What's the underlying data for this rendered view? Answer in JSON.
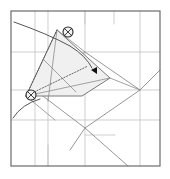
{
  "figure": {
    "type": "origami-crease-pattern",
    "title": "",
    "background_color": "#ffffff",
    "paper": {
      "name": "square-sheet",
      "x": 11,
      "y": 11,
      "width": 149,
      "height": 155,
      "border_color": "#6b6b6b",
      "border_width": 1.2,
      "fill": "#ffffff"
    },
    "grid": {
      "color": "#b9b9b9",
      "width": 0.7,
      "vertical_x": [
        35,
        48,
        85,
        140
      ],
      "horizontal_y": [
        52,
        90,
        120
      ]
    },
    "short_ticks": [
      {
        "name": "tick-top-center",
        "x1": 85,
        "y1": 11,
        "x2": 85,
        "y2": 24
      },
      {
        "name": "tick-top-right",
        "x1": 114,
        "y1": 11,
        "x2": 114,
        "y2": 24
      },
      {
        "name": "tick-bottom-left",
        "x1": 48,
        "y1": 166,
        "x2": 48,
        "y2": 145
      },
      {
        "name": "tick-mid-horizontal",
        "x1": 85,
        "y1": 135,
        "x2": 115,
        "y2": 135
      }
    ],
    "diamond": {
      "name": "rotated-square",
      "color": "#8a8a8a",
      "width": 0.9,
      "points": [
        [
          85,
          52
        ],
        [
          140,
          90
        ],
        [
          85,
          128
        ],
        [
          35,
          90
        ]
      ]
    },
    "diagonals": [
      {
        "name": "diagonal-lower-right",
        "x1": 85,
        "y1": 128,
        "x2": 128,
        "y2": 166
      },
      {
        "name": "diagonal-lower-left",
        "x1": 85,
        "y1": 128,
        "x2": 70,
        "y2": 150
      },
      {
        "name": "diagonal-right-edge",
        "x1": 140,
        "y1": 90,
        "x2": 160,
        "y2": 70
      }
    ],
    "flap": {
      "name": "folded-flap",
      "fill": "#f0f0f0",
      "stroke": "#7a7a7a",
      "stroke_width": 1.0,
      "points": [
        [
          26,
          96
        ],
        [
          57,
          30
        ],
        [
          110,
          78
        ],
        [
          82,
          96
        ]
      ]
    },
    "flap_inner_creases": [
      {
        "name": "flap-crease-a",
        "x1": 26,
        "y1": 96,
        "x2": 110,
        "y2": 78
      },
      {
        "name": "flap-crease-b",
        "x1": 44,
        "y1": 60,
        "x2": 76,
        "y2": 92
      },
      {
        "name": "flap-crease-c",
        "x1": 57,
        "y1": 30,
        "x2": 48,
        "y2": 101
      }
    ],
    "dotted_creases": [
      {
        "name": "dotted-crease-1",
        "x1": 26,
        "y1": 96,
        "x2": 57,
        "y2": 30
      },
      {
        "name": "dotted-crease-2",
        "x1": 26,
        "y1": 96,
        "x2": 88,
        "y2": 66
      }
    ],
    "arcs": [
      {
        "name": "rotation-arc-upper",
        "path": "M 14 22 Q 48 34 70 46 Q 86 56 92 68",
        "color": "#555555",
        "width": 1.0
      },
      {
        "name": "rotation-arc-lower",
        "path": "M 13 118 Q 22 104 40 99",
        "color": "#555555",
        "width": 1.0
      }
    ],
    "markers": [
      {
        "name": "reference-point-top",
        "label": "x",
        "cx": 68,
        "cy": 32,
        "r": 5,
        "stroke": "#2b2b2b",
        "fill": "#f2f2f2"
      },
      {
        "name": "reference-point-left",
        "label": "x",
        "cx": 31,
        "cy": 95,
        "r": 5,
        "stroke": "#2b2b2b",
        "fill": "#f2f2f2"
      }
    ],
    "arrowhead": {
      "name": "fold-direction-arrowhead",
      "points": [
        [
          91,
          70
        ],
        [
          97,
          67
        ],
        [
          97,
          74
        ]
      ],
      "fill": "#111111",
      "direction": "left"
    },
    "legs": [
      {
        "name": "flap-leg-left",
        "x1": 26,
        "y1": 96,
        "x2": 35,
        "y2": 90
      },
      {
        "name": "flap-leg-top",
        "x1": 57,
        "y1": 30,
        "x2": 85,
        "y2": 52
      },
      {
        "name": "flap-leg-tip",
        "x1": 110,
        "y1": 78,
        "x2": 140,
        "y2": 90
      },
      {
        "name": "flap-leg-bottom",
        "x1": 26,
        "y1": 96,
        "x2": 55,
        "y2": 120
      }
    ]
  }
}
